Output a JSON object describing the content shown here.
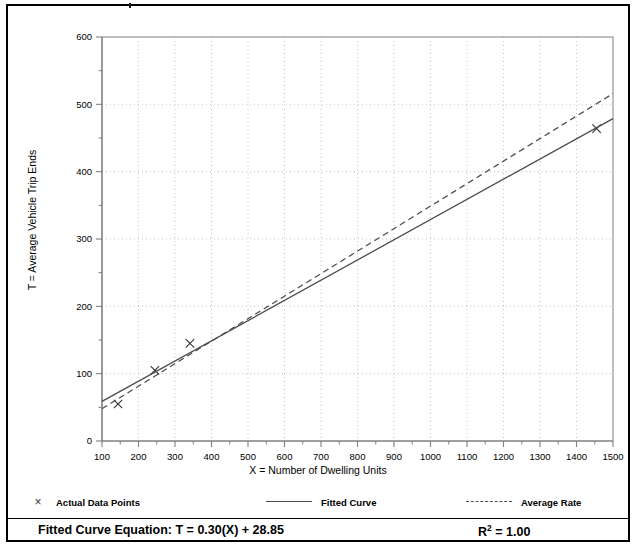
{
  "chart_data": {
    "type": "scatter",
    "title": "",
    "xlabel": "X = Number of Dwelling Units",
    "ylabel": "T = Average Vehicle Trip Ends",
    "xlim": [
      100,
      1500
    ],
    "ylim": [
      0,
      600
    ],
    "xticks": [
      100,
      200,
      300,
      400,
      500,
      600,
      700,
      800,
      900,
      1000,
      1100,
      1200,
      1300,
      1400,
      1500
    ],
    "yticks": [
      0,
      100,
      200,
      300,
      400,
      500,
      600
    ],
    "xtick_labels": [
      "100",
      "200",
      "300",
      "400",
      "500",
      "600",
      "700",
      "800",
      "900",
      "1000",
      "1100",
      "1200",
      "1300",
      "1400",
      "1500"
    ],
    "ytick_labels": [
      "0",
      "100",
      "200",
      "300",
      "400",
      "500",
      "600"
    ],
    "minor_tick_step_x": 50,
    "minor_tick_step_y": 50,
    "grid": true,
    "grid_style": "dotted",
    "legend_position": "below-plot",
    "series": [
      {
        "name": "Actual Data Points",
        "type": "scatter",
        "marker": "x",
        "points": [
          {
            "x": 144,
            "y": 55
          },
          {
            "x": 245,
            "y": 105
          },
          {
            "x": 341,
            "y": 145
          },
          {
            "x": 1455,
            "y": 464
          }
        ]
      },
      {
        "name": "Fitted Curve",
        "type": "line",
        "style": "solid",
        "slope": 0.3,
        "intercept": 28.85,
        "endpoints": [
          {
            "x": 100,
            "y": 58.85
          },
          {
            "x": 1500,
            "y": 478.85
          }
        ]
      },
      {
        "name": "Average Rate",
        "type": "line",
        "style": "dashed",
        "slope": 0.344,
        "intercept": 0,
        "endpoints": [
          {
            "x": 100,
            "y": 48
          },
          {
            "x": 1500,
            "y": 516
          }
        ]
      }
    ],
    "annotations": [
      {
        "name": "fitted-curve-equation",
        "text": "Fitted Curve Equation:  T = 0.30(X) + 28.85"
      },
      {
        "name": "r-squared",
        "text": "R2 = 1.00"
      }
    ]
  },
  "axes": {
    "y_title": "T = Average Vehicle Trip Ends",
    "x_title": "X = Number of Dwelling Units"
  },
  "legend": {
    "actual": "Actual Data Points",
    "fitted": "Fitted Curve",
    "average": "Average Rate",
    "marker_glyph": "×"
  },
  "equation": {
    "label": "Fitted Curve Equation:",
    "formula": "T = 0.30(X) + 28.85",
    "full": "Fitted Curve Equation:  T = 0.30(X) + 28.85",
    "r2_prefix": "R",
    "r2_sup": "2",
    "r2_value": "= 1.00"
  },
  "colors": {
    "line": "#4d4d4d",
    "grid": "#b3b3b3",
    "axis": "#808080",
    "text": "#000000",
    "border": "#000000"
  }
}
